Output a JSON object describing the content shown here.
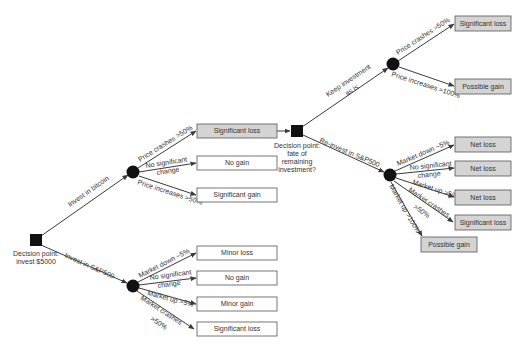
{
  "colors": {
    "decision_node": "#111111",
    "chance_node": "#111111",
    "box_white": "#ffffff",
    "box_gray": "#d4d4d4",
    "edge": "#3a3a3a"
  },
  "root": {
    "label_line1": "Decision point:",
    "label_line2": "invest $5000",
    "branches": {
      "bitcoin": "Invest in bitcoin",
      "sp500": "Invest in S&P500"
    }
  },
  "bitcoin": {
    "edges": {
      "crash": "Price crashes >50%",
      "nochange_line1": "No significant",
      "nochange_line2": "change",
      "increase": "Price increases >50%"
    },
    "outcomes": [
      {
        "label": "Significant loss",
        "highlight": true
      },
      {
        "label": "No gain",
        "highlight": false
      },
      {
        "label": "Significant gain",
        "highlight": false
      }
    ]
  },
  "sp500": {
    "edges": {
      "down": "Market down ~5%",
      "nochange_line1": "No significant",
      "nochange_line2": "change",
      "up": "Market up >5%",
      "crash_line1": "Market crashes",
      "crash_line2": ">50%"
    },
    "outcomes": [
      {
        "label": "Minor loss"
      },
      {
        "label": "No gain"
      },
      {
        "label": "Minor gain"
      },
      {
        "label": "Significant loss"
      }
    ]
  },
  "second_decision": {
    "label_lines": [
      "Decision point:",
      "fate of",
      "remaining",
      "investment?"
    ],
    "branches": {
      "keep_line1": "Keep investment",
      "keep_line2": "as is",
      "reinvest": "Re-invest in S&P500"
    }
  },
  "keep": {
    "edges": {
      "crash": "Price crashes >50%",
      "increase": "Price increases >100%"
    },
    "outcomes": [
      {
        "label": "Significant loss"
      },
      {
        "label": "Possible gain"
      }
    ]
  },
  "reinvest": {
    "edges": {
      "down": "Market down ~5%",
      "nochange_line1": "No significant",
      "nochange_line2": "change",
      "up": "Market up >5%",
      "crash_line1": "Market crashes",
      "crash_line2": ">50%",
      "bigup": "Market up >100%"
    },
    "outcomes": [
      {
        "label": "Net loss"
      },
      {
        "label": "Net loss"
      },
      {
        "label": "Net loss"
      },
      {
        "label": "Significant loss"
      },
      {
        "label": "Possible gain"
      }
    ]
  }
}
